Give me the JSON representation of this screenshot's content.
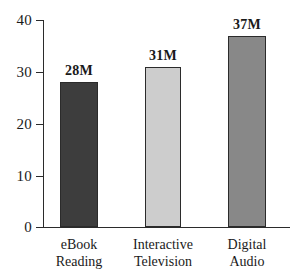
{
  "chart_data": {
    "type": "bar",
    "title": "",
    "subtitle": "",
    "xlabel": "",
    "ylabel": "",
    "categories": [
      "eBook Reading",
      "Interactive Television",
      "Digital Audio"
    ],
    "category_lines": [
      [
        "eBook",
        "Reading"
      ],
      [
        "Interactive",
        "Television"
      ],
      [
        "Digital",
        "Audio"
      ]
    ],
    "values": [
      28,
      31,
      37
    ],
    "data_labels": [
      "28M",
      "31M",
      "37M"
    ],
    "bar_colors": [
      "#3d3d3d",
      "#cdcdcd",
      "#888888"
    ],
    "bar_border_color": "#2b2b2b",
    "ylim": [
      0,
      40
    ],
    "yticks": [
      0,
      10,
      20,
      30,
      40
    ],
    "ytick_labels": [
      "0",
      "10",
      "20",
      "30",
      "40"
    ],
    "grid": false,
    "legend": "none",
    "axis_color": "#2b2b2b",
    "background": "#ffffff"
  }
}
